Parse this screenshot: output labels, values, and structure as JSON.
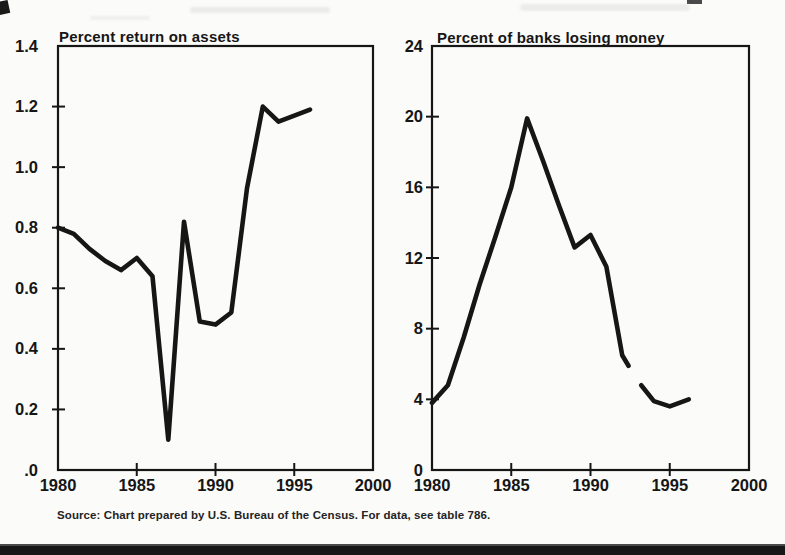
{
  "page": {
    "kind": "scanned statistical chart figure",
    "paper_color": "#fbfbfa",
    "ink_color": "#161616"
  },
  "source_note": "Source: Chart prepared by U.S. Bureau of the Census. For data, see table 786.",
  "chart_data": [
    {
      "type": "line",
      "title": "Percent return on assets",
      "xlabel": "",
      "ylabel": "Percent return on assets",
      "xlim": [
        1980,
        2000
      ],
      "ylim": [
        0,
        1.4
      ],
      "grid": false,
      "legend": "none",
      "y_tick_values": [
        1.2,
        1.0,
        0.8,
        0.6,
        0.4,
        0.2
      ],
      "y_labels": [
        [
          1.4,
          "1.4"
        ],
        [
          1.2,
          "1.2"
        ],
        [
          1.0,
          "1.0"
        ],
        [
          0.8,
          "0.8"
        ],
        [
          0.6,
          "0.6"
        ],
        [
          0.4,
          "0.4"
        ],
        [
          0.2,
          "0.2"
        ],
        [
          0,
          ".0"
        ]
      ],
      "x_tick_values": [
        1985,
        1990,
        1995
      ],
      "x_labels": [
        [
          1980,
          "1980"
        ],
        [
          1985,
          "1985"
        ],
        [
          1990,
          "1990"
        ],
        [
          1995,
          "1995"
        ],
        [
          2000,
          "2000"
        ]
      ],
      "series": [
        {
          "name": "Return on assets 1980-1996",
          "x": [
            1980,
            1981,
            1982,
            1983,
            1984,
            1985,
            1986,
            1987,
            1988,
            1989,
            1990,
            1991,
            1992,
            1993,
            1994,
            1995,
            1996
          ],
          "y": [
            0.8,
            0.78,
            0.73,
            0.69,
            0.66,
            0.7,
            0.64,
            0.1,
            0.82,
            0.49,
            0.48,
            0.52,
            0.93,
            1.2,
            1.15,
            1.17,
            1.19
          ]
        }
      ]
    },
    {
      "type": "line",
      "title": "Percent of banks losing money",
      "xlabel": "",
      "ylabel": "Percent of banks losing money",
      "xlim": [
        1980,
        2000
      ],
      "ylim": [
        0,
        24
      ],
      "grid": false,
      "legend": "none",
      "y_tick_values": [
        20,
        16,
        12,
        8,
        4
      ],
      "y_labels": [
        [
          24,
          "24"
        ],
        [
          20,
          "20"
        ],
        [
          16,
          "16"
        ],
        [
          12,
          "12"
        ],
        [
          8,
          "8"
        ],
        [
          4,
          "4"
        ],
        [
          0,
          "0"
        ]
      ],
      "x_tick_values": [
        1985,
        1990,
        1995
      ],
      "x_labels": [
        [
          1980,
          "1980"
        ],
        [
          1985,
          "1985"
        ],
        [
          1990,
          "1990"
        ],
        [
          1995,
          "1995"
        ],
        [
          2000,
          "2000"
        ]
      ],
      "series": [
        {
          "name": "Banks losing money 1980-1992",
          "x": [
            1980,
            1981,
            1982,
            1983,
            1984,
            1985,
            1986,
            1987,
            1988,
            1989,
            1990,
            1991,
            1992,
            1992.4
          ],
          "y": [
            3.8,
            4.8,
            7.5,
            10.5,
            13.2,
            16.0,
            19.9,
            17.5,
            15.0,
            12.6,
            13.3,
            11.5,
            6.5,
            5.9
          ]
        },
        {
          "name": "Banks losing money 1993-1996",
          "x": [
            1993.2,
            1994,
            1995,
            1996.2
          ],
          "y": [
            4.8,
            3.9,
            3.6,
            4.0
          ]
        }
      ]
    }
  ]
}
